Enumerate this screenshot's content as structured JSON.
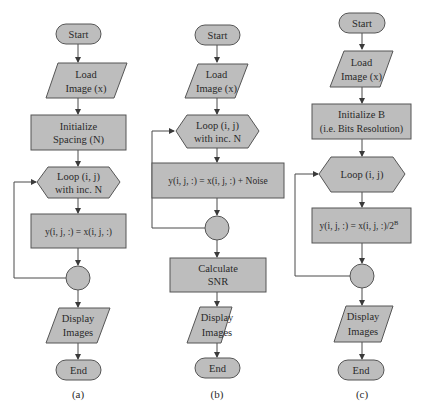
{
  "figure": {
    "colors": {
      "shape_fill": "#bdbdbd",
      "shape_stroke": "#555555",
      "edge": "#4a4a4a",
      "text": "#2a2a2a",
      "background": "#ffffff"
    },
    "flowcharts": [
      {
        "caption": "(a)",
        "nodes": {
          "start": "Start",
          "load_1": "Load",
          "load_2": "Image (x)",
          "init_1": "Initialize",
          "init_2": "Spacing (N)",
          "loop_1": "Loop (i, j)",
          "loop_2": "with inc. N",
          "op": "y(i, j, :) = x(i, j, :)",
          "display_1": "Display",
          "display_2": "Images",
          "end": "End"
        }
      },
      {
        "caption": "(b)",
        "nodes": {
          "start": "Start",
          "load_1": "Load",
          "load_2": "Image (x)",
          "loop_1": "Loop (i, j)",
          "loop_2": "with inc. N",
          "op": "y(i, j, :) = x(i, j, :) + Noise",
          "calc_1": "Calculate",
          "calc_2": "SNR",
          "display_1": "Display",
          "display_2": "Images",
          "end": "End"
        }
      },
      {
        "caption": "(c)",
        "nodes": {
          "start": "Start",
          "load_1": "Load",
          "load_2": "Image (x)",
          "init_1": "Initialize B",
          "init_2": "(i.e. Bits Resolution)",
          "loop_1": "Loop (i, j)",
          "op": "y(i, j, :) = x(i, j, :)/2",
          "op_sup": "B",
          "display_1": "Display",
          "display_2": "Images",
          "end": "End"
        }
      }
    ]
  }
}
